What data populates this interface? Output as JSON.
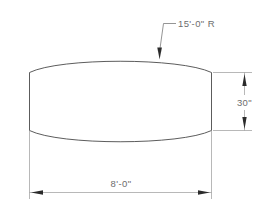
{
  "drawing": {
    "title": "Barrel Shape Plan Dimensions",
    "background_color": "#ffffff",
    "outline_color": "#4a4a4a",
    "dimension_line_color": "#9a9a9a",
    "text_color": "#6d6d6d",
    "arrow_color": "#2b2b2b",
    "shape": {
      "name": "barrel-outline",
      "description": "Barrel / cask shaped closed profile with straight vertical left and right sides and outward-bulging curved top and bottom edges"
    },
    "annotations": {
      "radius_callout": {
        "label": "15'-0\"  R",
        "value": "15'-0\"",
        "suffix": "R",
        "meaning": "radius of the curved top and bottom edges"
      },
      "height_dimension": {
        "label": "30\"",
        "value": "30\"",
        "meaning": "vertical height of the straight side walls"
      },
      "width_dimension": {
        "label": "8'-0\"",
        "value": "8'-0\"",
        "meaning": "overall width between left and right straight sides"
      }
    }
  }
}
